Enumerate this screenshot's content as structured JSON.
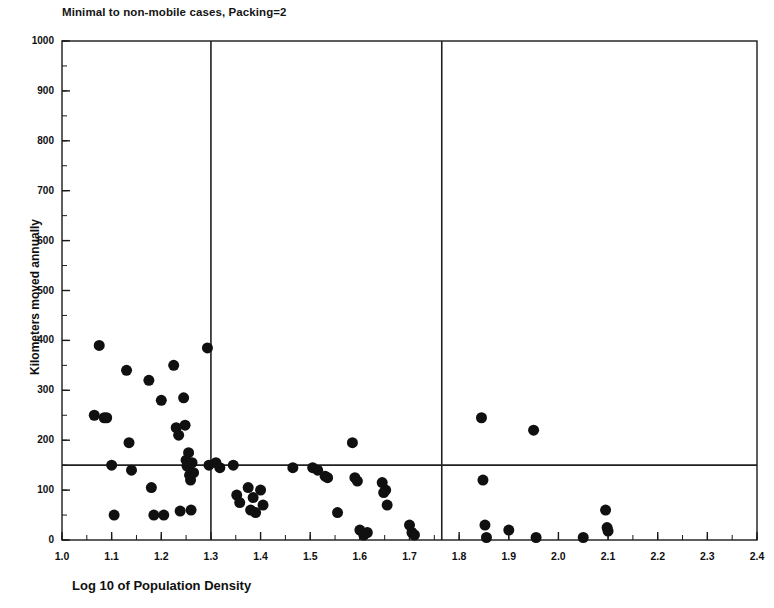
{
  "chart_data": {
    "type": "scatter",
    "title": "Minimal to non-mobile cases, Packing=2",
    "xlabel": "Log 10 of Population Density",
    "ylabel": "Kilometers moved annually",
    "xlim": [
      1.0,
      2.4
    ],
    "ylim": [
      0,
      1000
    ],
    "xticks": [
      "1.0",
      "1.1",
      "1.2",
      "1.3",
      "1.4",
      "1.5",
      "1.6",
      "1.7",
      "1.8",
      "1.9",
      "2.0",
      "2.1",
      "2.2",
      "2.3",
      "2.4"
    ],
    "xtick_values": [
      1.0,
      1.1,
      1.2,
      1.3,
      1.4,
      1.5,
      1.6,
      1.7,
      1.8,
      1.9,
      2.0,
      2.1,
      2.2,
      2.3,
      2.4
    ],
    "yticks": [
      "0",
      "100",
      "200",
      "300",
      "400",
      "500",
      "600",
      "700",
      "800",
      "900",
      "1000"
    ],
    "ytick_values": [
      0,
      100,
      200,
      300,
      400,
      500,
      600,
      700,
      800,
      900,
      1000
    ],
    "minor_tick_step_x": 0.05,
    "minor_tick_step_y": 50,
    "grid": false,
    "legend": null,
    "marker": {
      "shape": "circle",
      "color": "#101010",
      "size_px": 11
    },
    "reference_lines": [
      {
        "orientation": "vertical",
        "value": 1.3,
        "color": "#202020"
      },
      {
        "orientation": "vertical",
        "value": 1.765,
        "color": "#202020"
      },
      {
        "orientation": "horizontal",
        "value": 150,
        "color": "#202020"
      }
    ],
    "series": [
      {
        "name": "cases",
        "points": [
          [
            1.065,
            250
          ],
          [
            1.075,
            390
          ],
          [
            1.085,
            245
          ],
          [
            1.09,
            245
          ],
          [
            1.1,
            150
          ],
          [
            1.105,
            50
          ],
          [
            1.13,
            340
          ],
          [
            1.135,
            195
          ],
          [
            1.14,
            140
          ],
          [
            1.175,
            320
          ],
          [
            1.18,
            105
          ],
          [
            1.185,
            50
          ],
          [
            1.2,
            280
          ],
          [
            1.205,
            50
          ],
          [
            1.225,
            350
          ],
          [
            1.23,
            225
          ],
          [
            1.235,
            210
          ],
          [
            1.238,
            58
          ],
          [
            1.245,
            285
          ],
          [
            1.248,
            230
          ],
          [
            1.25,
            160
          ],
          [
            1.252,
            148
          ],
          [
            1.255,
            175
          ],
          [
            1.257,
            130
          ],
          [
            1.259,
            120
          ],
          [
            1.26,
            60
          ],
          [
            1.262,
            155
          ],
          [
            1.265,
            135
          ],
          [
            1.293,
            385
          ],
          [
            1.296,
            150
          ],
          [
            1.31,
            155
          ],
          [
            1.318,
            145
          ],
          [
            1.345,
            150
          ],
          [
            1.352,
            90
          ],
          [
            1.358,
            75
          ],
          [
            1.375,
            105
          ],
          [
            1.38,
            60
          ],
          [
            1.385,
            85
          ],
          [
            1.39,
            55
          ],
          [
            1.4,
            100
          ],
          [
            1.405,
            70
          ],
          [
            1.465,
            145
          ],
          [
            1.505,
            145
          ],
          [
            1.515,
            140
          ],
          [
            1.53,
            128
          ],
          [
            1.535,
            125
          ],
          [
            1.555,
            55
          ],
          [
            1.585,
            195
          ],
          [
            1.59,
            125
          ],
          [
            1.595,
            118
          ],
          [
            1.6,
            20
          ],
          [
            1.608,
            10
          ],
          [
            1.615,
            15
          ],
          [
            1.645,
            115
          ],
          [
            1.648,
            95
          ],
          [
            1.652,
            100
          ],
          [
            1.655,
            70
          ],
          [
            1.7,
            30
          ],
          [
            1.705,
            15
          ],
          [
            1.71,
            10
          ],
          [
            1.845,
            245
          ],
          [
            1.848,
            120
          ],
          [
            1.852,
            30
          ],
          [
            1.855,
            5
          ],
          [
            1.9,
            20
          ],
          [
            1.95,
            220
          ],
          [
            1.955,
            5
          ],
          [
            2.05,
            5
          ],
          [
            2.095,
            60
          ],
          [
            2.098,
            25
          ],
          [
            2.1,
            18
          ]
        ]
      }
    ]
  }
}
